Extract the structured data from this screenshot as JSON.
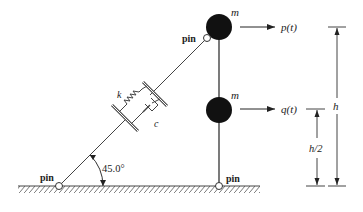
{
  "diagram": {
    "masses": [
      {
        "label": "m",
        "position": "top"
      },
      {
        "label": "m",
        "position": "middle"
      }
    ],
    "forces": [
      {
        "label": "p(t)",
        "applied_to": "top mass"
      },
      {
        "label": "q(t)",
        "applied_to": "middle mass"
      }
    ],
    "spring": {
      "label": "k"
    },
    "damper": {
      "label": "c"
    },
    "pins": [
      {
        "label": "pin",
        "location": "top of rod"
      },
      {
        "label": "pin",
        "location": "ground left"
      },
      {
        "label": "pin",
        "location": "ground base of rod"
      }
    ],
    "angle": {
      "label": "45.0°"
    },
    "dimensions": [
      {
        "label": "h"
      },
      {
        "label": "h/2"
      }
    ]
  }
}
